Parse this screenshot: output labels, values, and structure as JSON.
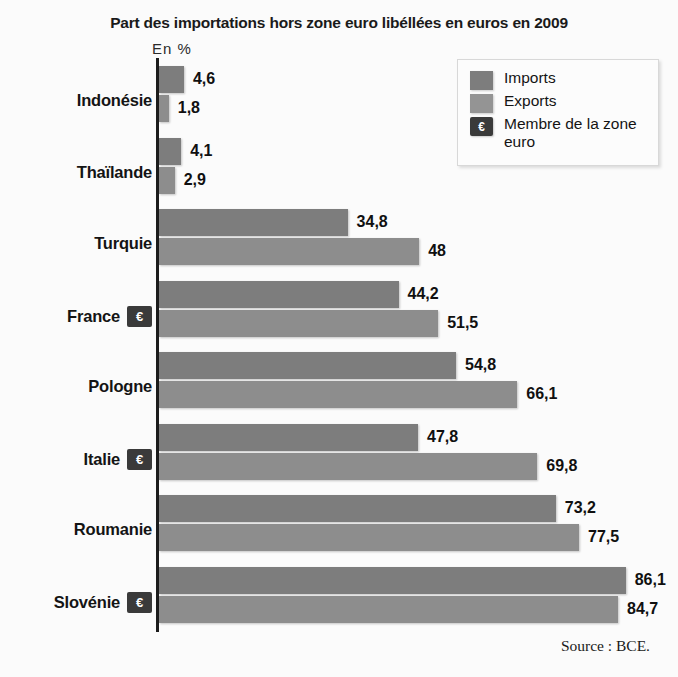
{
  "chart_data": {
    "type": "bar",
    "orientation": "horizontal",
    "title": "Part des importations hors zone euro libéllées en euros en 2009",
    "unit_label": "En  %",
    "xlabel": "",
    "ylabel": "",
    "xlim": [
      0,
      90
    ],
    "grid": false,
    "source": "Source : BCE.",
    "legend_position": "top-right",
    "categories": [
      "Indonésie",
      "Thaïlande",
      "Turquie",
      "France",
      "Pologne",
      "Italie",
      "Roumanie",
      "Slovénie"
    ],
    "euro_member": [
      false,
      false,
      false,
      true,
      false,
      true,
      false,
      true
    ],
    "series": [
      {
        "name": "Imports",
        "color": "#7d7d7d",
        "values": [
          4.6,
          4.1,
          34.8,
          44.2,
          54.8,
          47.8,
          73.2,
          86.1
        ],
        "labels": [
          "4,6",
          "4,1",
          "34,8",
          "44,2",
          "54,8",
          "47,8",
          "73,2",
          "86,1"
        ]
      },
      {
        "name": "Exports",
        "color": "#8d8d8d",
        "values": [
          1.8,
          2.9,
          48,
          51.5,
          66.1,
          69.8,
          77.5,
          84.7
        ],
        "labels": [
          "1,8",
          "2,9",
          "48",
          "51,5",
          "66,1",
          "69,8",
          "77,5",
          "84,7"
        ]
      }
    ]
  },
  "legend": {
    "items": [
      {
        "label": "Imports",
        "swatch": "imports"
      },
      {
        "label": "Exports",
        "swatch": "exports"
      },
      {
        "label": "Membre de la zone euro",
        "swatch": "euro",
        "glyph": "€"
      }
    ]
  },
  "euro_glyph": "€"
}
